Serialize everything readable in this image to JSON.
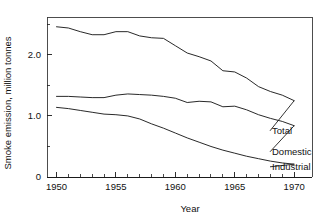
{
  "chart_data": {
    "type": "line",
    "title": "",
    "xlabel": "Year",
    "ylabel": "Smoke emission, million tonnes",
    "xlim": [
      1949.2,
      1971.5
    ],
    "ylim": [
      0,
      2.62
    ],
    "grid": false,
    "legend_position": "right-inline-labels",
    "xticks": [
      1950,
      1955,
      1960,
      1965,
      1970
    ],
    "xticklabels": [
      "1950",
      "1955",
      "1960",
      "1965",
      "1970"
    ],
    "x_minor_tick_step": 1,
    "yticks": [
      0,
      1.0,
      2.0
    ],
    "yticklabels": [
      "0",
      "1.0",
      "2.0"
    ],
    "y_minor_ticks": [
      0.5,
      1.5,
      2.5
    ],
    "x": [
      1950,
      1951,
      1952,
      1953,
      1954,
      1955,
      1956,
      1957,
      1958,
      1959,
      1960,
      1961,
      1962,
      1963,
      1964,
      1965,
      1966,
      1967,
      1968,
      1969,
      1970
    ],
    "series": [
      {
        "name": "Total",
        "label": "Total",
        "values": [
          2.46,
          2.44,
          2.38,
          2.33,
          2.33,
          2.38,
          2.38,
          2.31,
          2.28,
          2.27,
          2.15,
          2.03,
          1.97,
          1.9,
          1.74,
          1.72,
          1.62,
          1.48,
          1.4,
          1.34,
          1.25
        ]
      },
      {
        "name": "Domestic",
        "label": "Domestic",
        "values": [
          1.32,
          1.32,
          1.31,
          1.3,
          1.3,
          1.34,
          1.36,
          1.35,
          1.34,
          1.32,
          1.29,
          1.22,
          1.24,
          1.23,
          1.15,
          1.16,
          1.1,
          1.02,
          0.96,
          0.91,
          0.84
        ]
      },
      {
        "name": "Industrial",
        "label": "Industrial",
        "values": [
          1.14,
          1.12,
          1.09,
          1.06,
          1.03,
          1.02,
          1.0,
          0.95,
          0.87,
          0.8,
          0.72,
          0.64,
          0.57,
          0.5,
          0.44,
          0.39,
          0.34,
          0.3,
          0.26,
          0.23,
          0.21
        ]
      }
    ]
  }
}
